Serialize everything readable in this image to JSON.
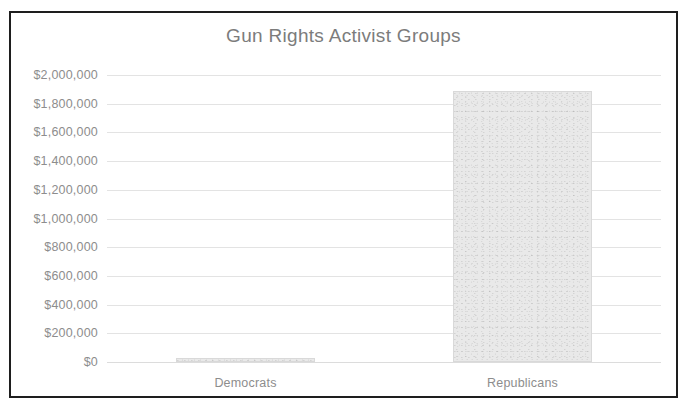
{
  "chart_data": {
    "type": "bar",
    "title": "Gun Rights Activist Groups",
    "xlabel": "",
    "ylabel": "",
    "categories": [
      "Democrats",
      "Republicans"
    ],
    "values": [
      25000,
      1890000
    ],
    "value_labels": [
      "$25,000",
      "$1,890,000"
    ],
    "ylim": [
      0,
      2000000
    ],
    "ytick_values": [
      0,
      200000,
      400000,
      600000,
      800000,
      1000000,
      1200000,
      1400000,
      1600000,
      1800000,
      2000000
    ],
    "ytick_labels": [
      "$0",
      "$200,000",
      "$400,000",
      "$600,000",
      "$800,000",
      "$1,000,000",
      "$1,200,000",
      "$1,400,000",
      "$1,600,000",
      "$1,800,000",
      "$2,000,000"
    ],
    "grid": true,
    "legend": false,
    "legend_position": "none",
    "bar_fill_color": "#e9e9e9",
    "bar_border_color": "#d9d9d9",
    "gridline_color": "#e3e3e3",
    "title_color": "#7c7c7c",
    "tick_label_color": "#8d8d8d",
    "frame_border_color": "#1e1e1e",
    "background_color": "#ffffff"
  },
  "clipped_caption": ""
}
